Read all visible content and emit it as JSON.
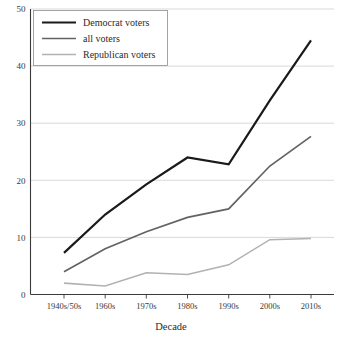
{
  "chart_data": {
    "type": "line",
    "title": "",
    "xlabel": "Decade",
    "ylabel": "",
    "categories": [
      "1940s/50s",
      "1960s",
      "1970s",
      "1980s",
      "1990s",
      "2000s",
      "2010s"
    ],
    "series": [
      {
        "name": "Democrat voters",
        "color": "#1a1a1a",
        "values": [
          7.3,
          14.0,
          19.3,
          24.0,
          22.8,
          34.0,
          44.5
        ]
      },
      {
        "name": "all voters",
        "color": "#636363",
        "values": [
          4.0,
          8.0,
          11.0,
          13.5,
          15.0,
          22.5,
          27.7
        ]
      },
      {
        "name": "Republican voters",
        "color": "#b2b2b2",
        "values": [
          2.0,
          1.5,
          3.8,
          3.5,
          5.2,
          9.6,
          9.8
        ]
      }
    ],
    "ylim": [
      0,
      50
    ],
    "ytick_labels": [
      "0",
      "10",
      "20",
      "30",
      "40",
      "50"
    ],
    "ytick_values": [
      0,
      10,
      20,
      30,
      40,
      50
    ],
    "grid": true,
    "legend_position": "top-left",
    "legend_entries": [
      "Democrat voters",
      "all voters",
      "Republican voters"
    ]
  },
  "axes": {
    "x_axis_title": "Decade"
  },
  "colors": {
    "democrat": "#1a1a1a",
    "all": "#636363",
    "republican": "#b2b2b2",
    "grid": "#c9c9c9",
    "axis": "#3a3a3a",
    "background": "#ffffff"
  }
}
